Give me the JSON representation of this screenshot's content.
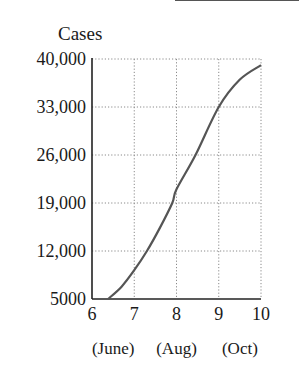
{
  "chart_data": {
    "type": "line",
    "title": "",
    "ylabel": "Cases",
    "xlabel": "",
    "xlim": [
      6,
      10
    ],
    "ylim": [
      5000,
      40000
    ],
    "x_ticks": [
      6,
      7,
      8,
      9,
      10
    ],
    "x_tick_labels": [
      "6",
      "7",
      "8",
      "9",
      "10"
    ],
    "x_month_labels": [
      {
        "x": 6.5,
        "label": "(June)"
      },
      {
        "x": 8,
        "label": "(Aug)"
      },
      {
        "x": 9.5,
        "label": "(Oct)"
      }
    ],
    "y_ticks": [
      5000,
      12000,
      19000,
      26000,
      33000,
      40000
    ],
    "y_tick_labels": [
      "5000",
      "12,000",
      "19,000",
      "26,000",
      "33,000",
      "40,000"
    ],
    "grid": true,
    "grid_style": "dotted",
    "legend": null,
    "series": [
      {
        "name": "Cases",
        "color": "#555555",
        "x": [
          6.38,
          6.7,
          7.0,
          7.3,
          7.6,
          7.9,
          8.0,
          8.45,
          9.0,
          9.5,
          10.0
        ],
        "y": [
          5000,
          6800,
          9200,
          12000,
          15300,
          19000,
          21000,
          26000,
          33000,
          37000,
          39100
        ]
      }
    ]
  },
  "labels": {
    "y_axis_title": "Cases",
    "y_ticks": [
      "40,000",
      "33,000",
      "26,000",
      "19,000",
      "12,000",
      "5000"
    ],
    "x_ticks": [
      "6",
      "7",
      "8",
      "9",
      "10"
    ],
    "months": [
      "(June)",
      "(Aug)",
      "(Oct)"
    ]
  }
}
